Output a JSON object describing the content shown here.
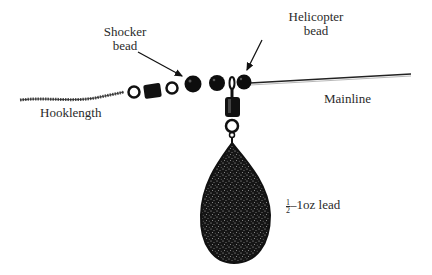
{
  "diagram": {
    "type": "fishing-rig-illustration",
    "labels": {
      "shocker_bead_line1": "Shocker",
      "shocker_bead_line2": "bead",
      "helicopter_bead_line1": "Helicopter",
      "helicopter_bead_line2": "bead",
      "mainline": "Mainline",
      "hooklength": "Hooklength",
      "lead_fraction_num": "1",
      "lead_fraction_den": "2",
      "lead_text": "–1oz lead"
    },
    "components": [
      {
        "id": "hooklength",
        "kind": "braided-line"
      },
      {
        "id": "swivel-horizontal",
        "kind": "swivel"
      },
      {
        "id": "shocker-bead",
        "kind": "bead"
      },
      {
        "id": "bead-2",
        "kind": "bead"
      },
      {
        "id": "helicopter-bead",
        "kind": "bead"
      },
      {
        "id": "swivel-vertical",
        "kind": "swivel"
      },
      {
        "id": "lead",
        "kind": "pear-lead"
      },
      {
        "id": "mainline",
        "kind": "line"
      }
    ],
    "colors": {
      "ink": "#111111",
      "text": "#2a2a2a",
      "background": "#ffffff"
    }
  }
}
